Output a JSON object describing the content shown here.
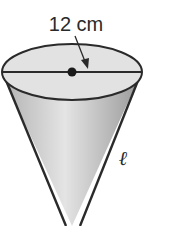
{
  "diagram": {
    "type": "cone",
    "diameter_label": "12 cm",
    "slant_label": "ℓ",
    "colors": {
      "stroke": "#2a2a2a",
      "fill_top": "#e0e0e0",
      "fill_side_light": "#e6e6e6",
      "fill_side_dark": "#a8a8a8"
    }
  }
}
